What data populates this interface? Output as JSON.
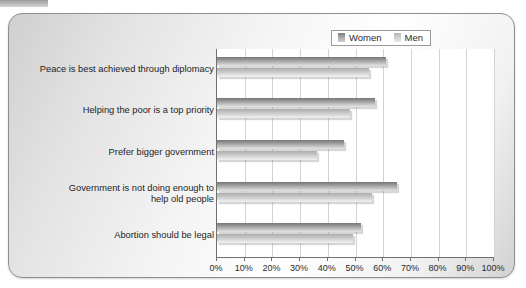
{
  "chart_data": {
    "type": "bar",
    "orientation": "horizontal",
    "title": "",
    "xlabel": "",
    "ylabel": "",
    "xlim": [
      0,
      100
    ],
    "xtick_step": 10,
    "grid": true,
    "legend_position": "top-right",
    "categories": [
      "Peace is best achieved through diplomacy",
      "Helping the poor is a top priority",
      "Prefer bigger government",
      "Government is not doing enough to help old people",
      "Abortion should be legal"
    ],
    "tick_labels": [
      "0%",
      "10%",
      "20%",
      "30%",
      "40%",
      "50%",
      "60%",
      "70%",
      "80%",
      "90%",
      "100%"
    ],
    "tick_values": [
      0,
      10,
      20,
      30,
      40,
      50,
      60,
      70,
      80,
      90,
      100
    ],
    "series": [
      {
        "name": "Women",
        "color": "#9b9b9b",
        "values": [
          61,
          57,
          46,
          65,
          52
        ]
      },
      {
        "name": "Men",
        "color": "#c6c6c6",
        "values": [
          55,
          48,
          36,
          56,
          49
        ]
      }
    ]
  },
  "legend": {
    "women_label": "Women",
    "men_label": "Men"
  },
  "category_lines": [
    [
      "Peace is best achieved through diplomacy"
    ],
    [
      "Helping the poor is a top priority"
    ],
    [
      "Prefer bigger government"
    ],
    [
      "Government is not doing enough to",
      "help old people"
    ],
    [
      "Abortion should be legal"
    ]
  ]
}
